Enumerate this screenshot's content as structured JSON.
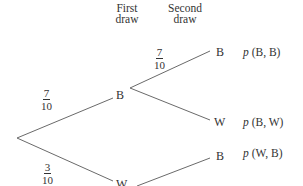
{
  "headers": {
    "first_draw": [
      "First",
      "draw"
    ],
    "second_draw": [
      "Second",
      "draw"
    ]
  },
  "nodes": {
    "first_b": "B",
    "first_w": "W",
    "second_bb": "B",
    "second_bw": "W",
    "second_wb": "B"
  },
  "branches": {
    "root_to_b": {
      "num": "7",
      "den": "10"
    },
    "root_to_w": {
      "num": "3",
      "den": "10"
    },
    "b_to_b": {
      "num": "7",
      "den": "10"
    }
  },
  "outcomes": {
    "bb": {
      "p": "p",
      "args": " (B, B)"
    },
    "bw": {
      "p": "p",
      "args": " (B, W)"
    },
    "wb": {
      "p": "p",
      "args": " (W, B)"
    }
  }
}
